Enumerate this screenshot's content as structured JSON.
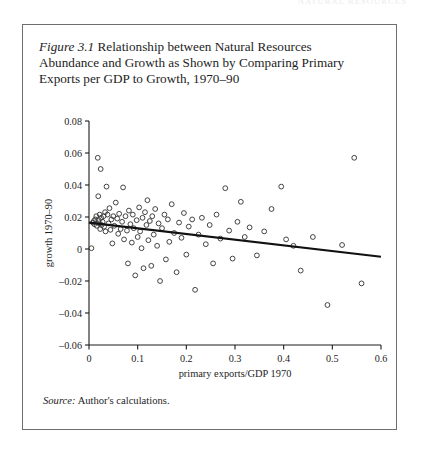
{
  "page": {
    "running_header": "NATURAL RESOURCES",
    "background_color": "#ffffff",
    "frame_color": "#6e6e70"
  },
  "figure": {
    "caption_number": "Figure 3.1",
    "caption_text": " Relationship between Natural Resources Abundance and Growth as Shown by Comparing Primary Exports per GDP to Growth, 1970–90",
    "source_label": "Source:",
    "source_text": " Author's calculations."
  },
  "chart_data": {
    "type": "scatter",
    "title": "",
    "xlabel": "primary exports/GDP 1970",
    "ylabel": "growth 1970–90",
    "xlim": [
      0,
      0.6
    ],
    "ylim": [
      -0.06,
      0.08
    ],
    "xticks": [
      0,
      0.1,
      0.2,
      0.3,
      0.4,
      0.5,
      0.6
    ],
    "xtick_labels": [
      "0",
      "0.1",
      "0.2",
      "0.3",
      "0.4",
      "0.5",
      "0.6"
    ],
    "yticks": [
      -0.06,
      -0.04,
      -0.02,
      0,
      0.02,
      0.04,
      0.06,
      0.08
    ],
    "ytick_labels": [
      "-0.06",
      "-0.04",
      "-0.02",
      "0",
      "0.02",
      "0.04",
      "0.06",
      "0.08"
    ],
    "grid": false,
    "legend": false,
    "marker": {
      "style": "open-circle",
      "radius": 2.4,
      "edge_color": "#3a3a3a",
      "fill": "none"
    },
    "trendline": {
      "label": "fitted regression line",
      "color": "#111111",
      "width": 2.1,
      "x": [
        0.0,
        0.6
      ],
      "y": [
        0.0165,
        -0.0048
      ]
    },
    "points": [
      [
        0.005,
        0.0005
      ],
      [
        0.008,
        0.0165
      ],
      [
        0.01,
        0.0175
      ],
      [
        0.011,
        0.0155
      ],
      [
        0.013,
        0.0185
      ],
      [
        0.015,
        0.0205
      ],
      [
        0.016,
        0.0145
      ],
      [
        0.018,
        0.057
      ],
      [
        0.019,
        0.033
      ],
      [
        0.02,
        0.018
      ],
      [
        0.021,
        0.016
      ],
      [
        0.022,
        0.0215
      ],
      [
        0.023,
        0.0125
      ],
      [
        0.024,
        0.05
      ],
      [
        0.025,
        0.0195
      ],
      [
        0.026,
        0.015
      ],
      [
        0.028,
        0.017
      ],
      [
        0.03,
        0.0205
      ],
      [
        0.031,
        0.014
      ],
      [
        0.033,
        0.023
      ],
      [
        0.034,
        0.011
      ],
      [
        0.036,
        0.039
      ],
      [
        0.038,
        0.0215
      ],
      [
        0.04,
        0.016
      ],
      [
        0.042,
        0.0255
      ],
      [
        0.044,
        0.012
      ],
      [
        0.046,
        0.0185
      ],
      [
        0.048,
        0.0035
      ],
      [
        0.05,
        0.0205
      ],
      [
        0.052,
        0.0145
      ],
      [
        0.055,
        0.029
      ],
      [
        0.058,
        0.019
      ],
      [
        0.06,
        0.0095
      ],
      [
        0.062,
        0.022
      ],
      [
        0.065,
        0.0125
      ],
      [
        0.068,
        0.017
      ],
      [
        0.07,
        0.0385
      ],
      [
        0.072,
        0.006
      ],
      [
        0.075,
        0.0205
      ],
      [
        0.078,
        0.0115
      ],
      [
        0.08,
        -0.009
      ],
      [
        0.082,
        0.024
      ],
      [
        0.085,
        0.0155
      ],
      [
        0.088,
        0.004
      ],
      [
        0.09,
        0.0215
      ],
      [
        0.092,
        0.013
      ],
      [
        0.095,
        -0.0165
      ],
      [
        0.098,
        0.018
      ],
      [
        0.1,
        0.0075
      ],
      [
        0.103,
        0.026
      ],
      [
        0.105,
        0.011
      ],
      [
        0.108,
        0.0005
      ],
      [
        0.11,
        0.0195
      ],
      [
        0.112,
        -0.012
      ],
      [
        0.115,
        0.023
      ],
      [
        0.118,
        0.015
      ],
      [
        0.12,
        0.0305
      ],
      [
        0.122,
        0.0055
      ],
      [
        0.125,
        0.0175
      ],
      [
        0.128,
        -0.0105
      ],
      [
        0.13,
        0.0205
      ],
      [
        0.133,
        0.009
      ],
      [
        0.136,
        0.025
      ],
      [
        0.14,
        0.002
      ],
      [
        0.143,
        0.016
      ],
      [
        0.146,
        -0.02
      ],
      [
        0.15,
        0.013
      ],
      [
        0.155,
        0.0215
      ],
      [
        0.158,
        -0.0065
      ],
      [
        0.162,
        0.0185
      ],
      [
        0.165,
        0.0045
      ],
      [
        0.17,
        0.028
      ],
      [
        0.175,
        0.01
      ],
      [
        0.18,
        -0.0145
      ],
      [
        0.185,
        0.0165
      ],
      [
        0.19,
        0.007
      ],
      [
        0.195,
        0.0225
      ],
      [
        0.2,
        -0.0035
      ],
      [
        0.205,
        0.014
      ],
      [
        0.212,
        0.0185
      ],
      [
        0.218,
        -0.0255
      ],
      [
        0.225,
        0.009
      ],
      [
        0.232,
        0.0195
      ],
      [
        0.24,
        0.003
      ],
      [
        0.248,
        0.015
      ],
      [
        0.255,
        -0.009
      ],
      [
        0.262,
        0.0215
      ],
      [
        0.27,
        0.0065
      ],
      [
        0.28,
        0.038
      ],
      [
        0.288,
        0.0115
      ],
      [
        0.295,
        -0.006
      ],
      [
        0.305,
        0.017
      ],
      [
        0.312,
        0.0295
      ],
      [
        0.32,
        0.0075
      ],
      [
        0.33,
        0.0135
      ],
      [
        0.345,
        -0.004
      ],
      [
        0.36,
        0.011
      ],
      [
        0.375,
        0.025
      ],
      [
        0.395,
        0.039
      ],
      [
        0.405,
        0.006
      ],
      [
        0.42,
        0.002
      ],
      [
        0.435,
        -0.0135
      ],
      [
        0.46,
        0.0075
      ],
      [
        0.49,
        -0.035
      ],
      [
        0.52,
        0.0025
      ],
      [
        0.545,
        0.057
      ],
      [
        0.56,
        -0.0215
      ]
    ]
  }
}
